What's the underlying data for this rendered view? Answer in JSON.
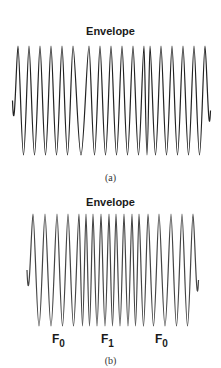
{
  "panel_a": {
    "title": "Envelope",
    "caption": "(a)",
    "description": "Continuous-phase FSK-like waveform with two phase discontinuities",
    "peaks_x": [
      18,
      29,
      40,
      51,
      62,
      73,
      89,
      100,
      111,
      122,
      133,
      144,
      150,
      161,
      172,
      183,
      194,
      205
    ],
    "y_top": 46,
    "y_bottom": 155,
    "stroke": "#222222"
  },
  "panel_b": {
    "title": "Envelope",
    "caption": "(b)",
    "description": "Frequency-shifted waveform: lower frequency F0, higher frequency F1 in middle, then F0",
    "peaks_x": [
      33,
      45,
      57,
      68,
      79,
      86,
      93,
      101,
      109,
      116,
      124,
      132,
      139,
      148,
      159,
      171,
      182,
      193
    ],
    "y_top": 214,
    "y_bottom": 326,
    "stroke": "#444444",
    "freq_labels": [
      {
        "base": "F",
        "sub": "0",
        "x": 54
      },
      {
        "base": "F",
        "sub": "1",
        "x": 103
      },
      {
        "base": "F",
        "sub": "0",
        "x": 157
      }
    ]
  }
}
